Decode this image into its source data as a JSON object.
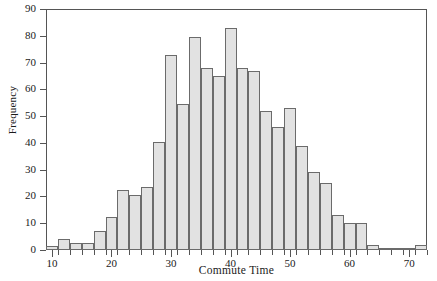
{
  "chart_data": {
    "type": "bar",
    "title": "",
    "subtitle": "",
    "xlabel": "Commute Time",
    "ylabel": "Frequency",
    "xlim": [
      9,
      73
    ],
    "ylim": [
      0,
      90
    ],
    "bin_width": 2,
    "grid": false,
    "legend": null,
    "xticks": [
      10,
      20,
      30,
      40,
      50,
      60,
      70
    ],
    "xtick_labels": [
      "10",
      "20",
      "30",
      "40",
      "50",
      "60",
      "70"
    ],
    "xminor_ticks": [
      11,
      13,
      15,
      17,
      19,
      21,
      23,
      25,
      27,
      29,
      31,
      33,
      35,
      37,
      39,
      41,
      43,
      45,
      47,
      49,
      51,
      53,
      55,
      57,
      59,
      61,
      63,
      65,
      67,
      69,
      71,
      73
    ],
    "yticks": [
      0,
      10,
      20,
      30,
      40,
      50,
      60,
      70,
      80,
      90
    ],
    "ytick_labels": [
      "0",
      "10",
      "20",
      "30",
      "40",
      "50",
      "60",
      "70",
      "80",
      "90"
    ],
    "bin_starts": [
      9,
      11,
      13,
      15,
      17,
      19,
      21,
      23,
      25,
      27,
      29,
      31,
      33,
      35,
      37,
      39,
      41,
      43,
      45,
      47,
      49,
      51,
      53,
      55,
      57,
      59,
      61,
      63,
      65,
      67,
      69,
      71
    ],
    "bin_ends": [
      11,
      13,
      15,
      17,
      19,
      21,
      23,
      25,
      27,
      29,
      31,
      33,
      35,
      37,
      39,
      41,
      43,
      45,
      47,
      49,
      51,
      53,
      55,
      57,
      59,
      61,
      63,
      65,
      67,
      69,
      71,
      73
    ],
    "categories": [
      "9-11",
      "11-13",
      "13-15",
      "15-17",
      "17-19",
      "19-21",
      "21-23",
      "23-25",
      "25-27",
      "27-29",
      "29-31",
      "31-33",
      "33-35",
      "35-37",
      "37-39",
      "39-41",
      "41-43",
      "43-45",
      "45-47",
      "47-49",
      "49-51",
      "51-53",
      "53-55",
      "55-57",
      "57-59",
      "59-61",
      "61-63",
      "63-65",
      "65-67",
      "67-69",
      "69-71",
      "71-73"
    ],
    "values": [
      1.5,
      4,
      2.5,
      2.5,
      7,
      12.5,
      22.5,
      20.5,
      23.5,
      40.5,
      73,
      54.5,
      79.5,
      68,
      65,
      83,
      68,
      67,
      52,
      46,
      53,
      39,
      29,
      25,
      13,
      10,
      10,
      2,
      0.3,
      0.3,
      0,
      2
    ],
    "bar_fill": "#e2e2e2",
    "bar_edge": "#6b6b6b"
  },
  "axes": {
    "frame_color": "#555555",
    "y_title": "Frequency",
    "x_title": "Commute Time"
  }
}
